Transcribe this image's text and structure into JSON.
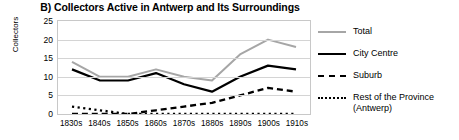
{
  "chart_data": {
    "type": "line",
    "title": "B) Collectors Active in Antwerp and Its Surroundings",
    "xlabel": "",
    "ylabel": "Collectors",
    "categories": [
      "1830s",
      "1840s",
      "1850s",
      "1860s",
      "1870s",
      "1880s",
      "1890s",
      "1900s",
      "1910s"
    ],
    "ylim": [
      0,
      25
    ],
    "yticks": [
      "0",
      "5",
      "10",
      "15",
      "20",
      "25"
    ],
    "grid": true,
    "legend_position": "right",
    "series": [
      {
        "name": "Total",
        "color": "#a6a6a6",
        "style": "solid",
        "values": [
          14,
          10,
          10,
          12,
          10,
          9,
          16,
          20,
          18
        ]
      },
      {
        "name": "City Centre",
        "color": "#000000",
        "style": "solid",
        "values": [
          12,
          9,
          9,
          11,
          8,
          6,
          10,
          13,
          12
        ]
      },
      {
        "name": "Suburb",
        "color": "#000000",
        "style": "dashed",
        "values": [
          0,
          0,
          0,
          1,
          2,
          3,
          5,
          7,
          6
        ]
      },
      {
        "name": "Rest of the Province\n(Antwerp)",
        "color": "#000000",
        "style": "dotted",
        "values": [
          2,
          1,
          0,
          0,
          0,
          0,
          0,
          0,
          0
        ]
      }
    ]
  }
}
